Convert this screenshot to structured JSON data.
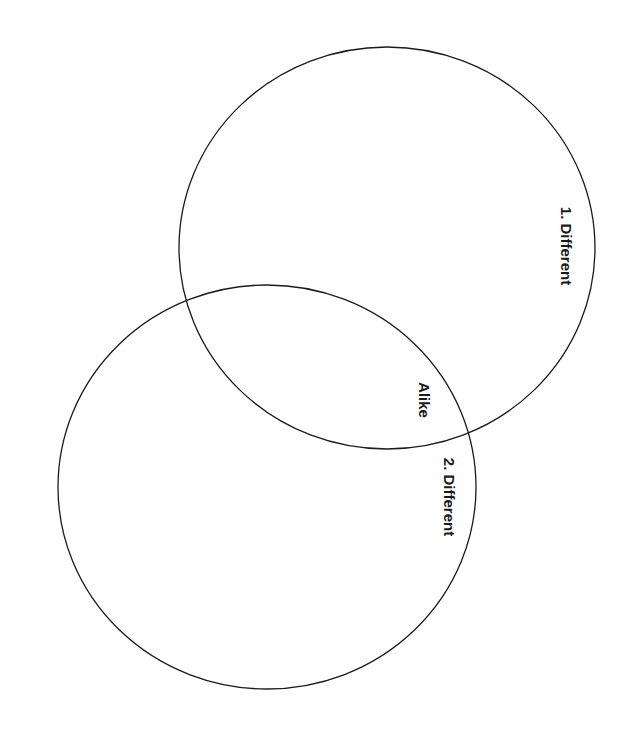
{
  "diagram": {
    "type": "venn",
    "background": "#ffffff",
    "stroke_color": "#1a1a1a",
    "circles": [
      {
        "id": "circle-1",
        "cx": 387,
        "cy": 248,
        "rx": 208,
        "ry": 201
      },
      {
        "id": "circle-2",
        "cx": 267,
        "cy": 487,
        "rx": 209,
        "ry": 202
      }
    ],
    "labels": {
      "different_1": "1. Different",
      "alike": "Alike",
      "different_2": "2. Different"
    },
    "label_positions": {
      "different_1": {
        "x": 566,
        "y": 246
      },
      "alike": {
        "x": 424,
        "y": 400
      },
      "different_2": {
        "x": 449,
        "y": 497
      }
    }
  }
}
